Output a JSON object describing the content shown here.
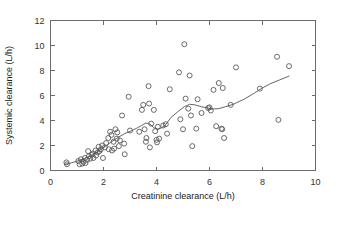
{
  "chart_data": {
    "type": "scatter",
    "title": "",
    "xlabel": "Creatinine clearance (L/h)",
    "ylabel": "Systemic clearance (L/h)",
    "xlim": [
      0,
      10
    ],
    "ylim": [
      0,
      12
    ],
    "xticks": [
      0,
      2,
      4,
      6,
      8,
      10
    ],
    "yticks": [
      0,
      2,
      4,
      6,
      8,
      10,
      12
    ],
    "xtick_labels": [
      "0",
      "2",
      "4",
      "6",
      "8",
      "10"
    ],
    "ytick_labels": [
      "0",
      "2",
      "4",
      "6",
      "8",
      "10",
      "12"
    ],
    "grid": false,
    "legend": null,
    "marker": "open-circle",
    "marker_color": "#5a5a5a",
    "line_color": "#555555",
    "points": [
      [
        0.6,
        0.65
      ],
      [
        0.62,
        0.5
      ],
      [
        1.05,
        0.75
      ],
      [
        1.1,
        0.5
      ],
      [
        1.15,
        0.9
      ],
      [
        1.2,
        0.55
      ],
      [
        1.25,
        0.7
      ],
      [
        1.3,
        1.0
      ],
      [
        1.32,
        0.6
      ],
      [
        1.38,
        0.85
      ],
      [
        1.42,
        1.55
      ],
      [
        1.45,
        1.15
      ],
      [
        1.5,
        0.95
      ],
      [
        1.55,
        1.25
      ],
      [
        1.6,
        1.35
      ],
      [
        1.62,
        1.0
      ],
      [
        1.7,
        1.6
      ],
      [
        1.72,
        1.2
      ],
      [
        1.78,
        1.45
      ],
      [
        1.82,
        1.9
      ],
      [
        1.85,
        1.55
      ],
      [
        1.9,
        1.7
      ],
      [
        1.95,
        2.0
      ],
      [
        1.98,
        1.0
      ],
      [
        2.05,
        1.85
      ],
      [
        2.1,
        2.2
      ],
      [
        2.18,
        2.6
      ],
      [
        2.2,
        1.7
      ],
      [
        2.25,
        3.1
      ],
      [
        2.3,
        2.85
      ],
      [
        2.32,
        1.6
      ],
      [
        2.38,
        2.3
      ],
      [
        2.4,
        1.75
      ],
      [
        2.45,
        3.3
      ],
      [
        2.5,
        2.55
      ],
      [
        2.52,
        3.05
      ],
      [
        2.58,
        1.95
      ],
      [
        2.62,
        2.4
      ],
      [
        2.7,
        4.4
      ],
      [
        2.78,
        2.15
      ],
      [
        2.8,
        1.3
      ],
      [
        2.95,
        5.9
      ],
      [
        3.0,
        3.2
      ],
      [
        3.35,
        3.1
      ],
      [
        3.45,
        4.85
      ],
      [
        3.5,
        5.25
      ],
      [
        3.55,
        3.3
      ],
      [
        3.6,
        2.3
      ],
      [
        3.62,
        2.6
      ],
      [
        3.7,
        6.75
      ],
      [
        3.72,
        5.35
      ],
      [
        3.75,
        1.85
      ],
      [
        3.8,
        3.75
      ],
      [
        3.9,
        4.85
      ],
      [
        3.95,
        3.15
      ],
      [
        4.0,
        2.45
      ],
      [
        4.02,
        2.25
      ],
      [
        4.05,
        3.5
      ],
      [
        4.1,
        2.55
      ],
      [
        4.25,
        3.6
      ],
      [
        4.35,
        3.7
      ],
      [
        4.4,
        2.95
      ],
      [
        4.5,
        6.5
      ],
      [
        4.85,
        7.85
      ],
      [
        4.9,
        4.1
      ],
      [
        5.0,
        3.3
      ],
      [
        5.05,
        10.1
      ],
      [
        5.1,
        5.75
      ],
      [
        5.2,
        4.95
      ],
      [
        5.25,
        7.6
      ],
      [
        5.3,
        4.4
      ],
      [
        5.35,
        1.95
      ],
      [
        5.5,
        3.35
      ],
      [
        5.55,
        5.7
      ],
      [
        5.7,
        4.6
      ],
      [
        5.95,
        5.0
      ],
      [
        6.0,
        5.05
      ],
      [
        6.05,
        4.8
      ],
      [
        6.15,
        6.45
      ],
      [
        6.25,
        3.55
      ],
      [
        6.35,
        7.0
      ],
      [
        6.45,
        3.35
      ],
      [
        6.48,
        3.3
      ],
      [
        6.5,
        6.6
      ],
      [
        6.55,
        2.6
      ],
      [
        6.8,
        5.25
      ],
      [
        7.0,
        8.25
      ],
      [
        7.9,
        6.55
      ],
      [
        8.55,
        9.1
      ],
      [
        8.6,
        4.05
      ],
      [
        9.0,
        8.35
      ]
    ],
    "trend_line": [
      [
        0.55,
        0.5
      ],
      [
        0.8,
        0.62
      ],
      [
        1.05,
        0.78
      ],
      [
        1.3,
        0.98
      ],
      [
        1.55,
        1.22
      ],
      [
        1.8,
        1.52
      ],
      [
        2.05,
        1.9
      ],
      [
        2.3,
        2.3
      ],
      [
        2.55,
        2.65
      ],
      [
        2.8,
        2.95
      ],
      [
        3.05,
        3.18
      ],
      [
        3.25,
        3.38
      ],
      [
        3.45,
        3.62
      ],
      [
        3.6,
        3.8
      ],
      [
        3.75,
        3.72
      ],
      [
        3.9,
        3.42
      ],
      [
        4.05,
        3.3
      ],
      [
        4.2,
        3.42
      ],
      [
        4.35,
        3.68
      ],
      [
        4.55,
        4.25
      ],
      [
        4.8,
        4.7
      ],
      [
        5.05,
        5.1
      ],
      [
        5.25,
        5.3
      ],
      [
        5.45,
        5.25
      ],
      [
        5.7,
        5.1
      ],
      [
        5.95,
        5.0
      ],
      [
        6.1,
        4.92
      ],
      [
        6.35,
        4.95
      ],
      [
        6.6,
        5.1
      ],
      [
        6.9,
        5.3
      ],
      [
        7.3,
        5.7
      ],
      [
        7.7,
        6.2
      ],
      [
        7.95,
        6.55
      ],
      [
        8.3,
        6.95
      ],
      [
        8.65,
        7.25
      ],
      [
        9.0,
        7.55
      ]
    ]
  }
}
